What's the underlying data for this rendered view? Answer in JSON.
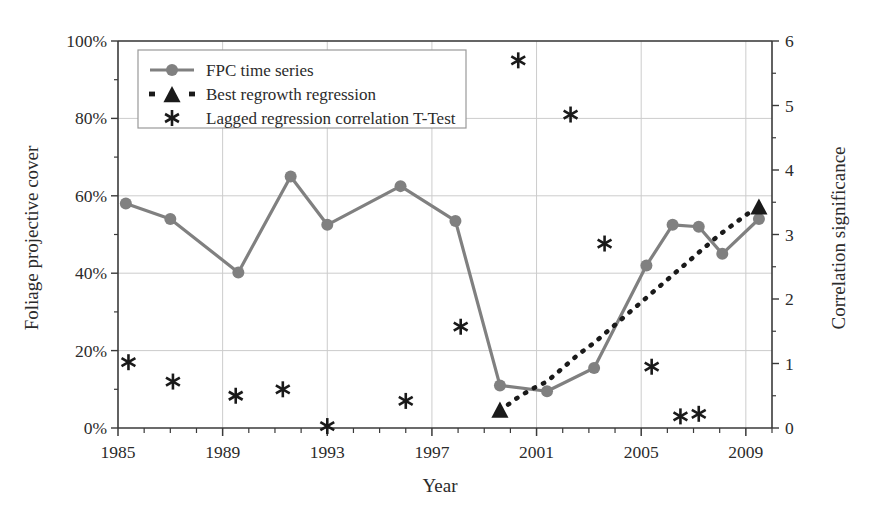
{
  "chart_data": {
    "type": "line",
    "title": "",
    "xlabel": "Year",
    "ylabel": "Foliage projective cover",
    "y2label": "Correlation significance",
    "xlim": [
      1985,
      2010
    ],
    "ylim": [
      0,
      100
    ],
    "y2lim": [
      0,
      6
    ],
    "grid": true,
    "legend_position": "top-left",
    "x_ticks": [
      1985,
      1989,
      1993,
      1997,
      2001,
      2005,
      2009
    ],
    "x_tick_labels": [
      "1985",
      "1989",
      "1993",
      "1997",
      "2001",
      "2005",
      "2009"
    ],
    "x_minor_tick_step": 1,
    "y_ticks": [
      0,
      20,
      40,
      60,
      80,
      100
    ],
    "y_tick_labels": [
      "0%",
      "20%",
      "40%",
      "60%",
      "80%",
      "100%"
    ],
    "y_minor_tick_step": 10,
    "y2_ticks": [
      0,
      1,
      2,
      3,
      4,
      5,
      6
    ],
    "y2_tick_labels": [
      "0",
      "1",
      "2",
      "3",
      "4",
      "5",
      "6"
    ],
    "series": [
      {
        "name": "FPC time series",
        "type": "line",
        "marker": "circle",
        "axis": "left",
        "color": "#808080",
        "points": [
          {
            "x": 1985.3,
            "y": 58.0
          },
          {
            "x": 1987.0,
            "y": 54.0
          },
          {
            "x": 1989.6,
            "y": 40.2
          },
          {
            "x": 1991.6,
            "y": 65.0
          },
          {
            "x": 1993.0,
            "y": 52.5
          },
          {
            "x": 1995.8,
            "y": 62.5
          },
          {
            "x": 1997.9,
            "y": 53.5
          },
          {
            "x": 1999.6,
            "y": 11.0
          },
          {
            "x": 2001.4,
            "y": 9.5
          },
          {
            "x": 2003.2,
            "y": 15.5
          },
          {
            "x": 2005.2,
            "y": 42.0
          },
          {
            "x": 2006.2,
            "y": 52.5
          },
          {
            "x": 2007.2,
            "y": 52.0
          },
          {
            "x": 2008.1,
            "y": 45.0
          },
          {
            "x": 2009.5,
            "y": 54.0
          }
        ]
      },
      {
        "name": "Best regrowth regression",
        "type": "dotted-line",
        "marker": "triangle",
        "axis": "left",
        "color": "#1a1a1a",
        "points": [
          {
            "x": 1999.6,
            "y": 4.5
          },
          {
            "x": 2000.2,
            "y": 7.5
          },
          {
            "x": 2000.8,
            "y": 10.0
          },
          {
            "x": 2001.4,
            "y": 12.0
          },
          {
            "x": 2002.0,
            "y": 15.5
          },
          {
            "x": 2002.6,
            "y": 19.0
          },
          {
            "x": 2003.2,
            "y": 22.0
          },
          {
            "x": 2003.8,
            "y": 25.5
          },
          {
            "x": 2004.4,
            "y": 29.0
          },
          {
            "x": 2005.0,
            "y": 32.5
          },
          {
            "x": 2005.6,
            "y": 36.0
          },
          {
            "x": 2006.2,
            "y": 39.5
          },
          {
            "x": 2006.8,
            "y": 43.0
          },
          {
            "x": 2007.4,
            "y": 46.5
          },
          {
            "x": 2008.0,
            "y": 50.0
          },
          {
            "x": 2008.6,
            "y": 53.0
          },
          {
            "x": 2009.3,
            "y": 56.5
          }
        ],
        "markers_at": [
          {
            "x": 1999.6,
            "y": 4.5
          },
          {
            "x": 2009.5,
            "y": 57.0
          }
        ]
      },
      {
        "name": "Lagged regression correlation T-Test",
        "type": "scatter",
        "marker": "asterisk",
        "axis": "right",
        "color": "#1a1a1a",
        "points": [
          {
            "x": 1985.4,
            "y": 1.02
          },
          {
            "x": 1987.1,
            "y": 0.72
          },
          {
            "x": 1989.5,
            "y": 0.5
          },
          {
            "x": 1991.3,
            "y": 0.6
          },
          {
            "x": 1993.0,
            "y": 0.03
          },
          {
            "x": 1996.0,
            "y": 0.42
          },
          {
            "x": 1998.1,
            "y": 1.57
          },
          {
            "x": 2000.3,
            "y": 5.7
          },
          {
            "x": 2002.3,
            "y": 4.86
          },
          {
            "x": 2003.6,
            "y": 2.86
          },
          {
            "x": 2005.4,
            "y": 0.95
          },
          {
            "x": 2006.5,
            "y": 0.18
          },
          {
            "x": 2007.2,
            "y": 0.22
          }
        ]
      }
    ]
  },
  "legend": {
    "items": [
      {
        "label": "FPC time series",
        "marker": "circle-line"
      },
      {
        "label": "Best regrowth regression",
        "marker": "triangle-dotted"
      },
      {
        "label": "Lagged regression correlation T-Test",
        "marker": "asterisk"
      }
    ]
  },
  "colors": {
    "fpc_series": "#808080",
    "regression": "#1a1a1a",
    "ttest": "#1a1a1a",
    "grid": "#cccccc",
    "axis": "#3a3a3a"
  }
}
